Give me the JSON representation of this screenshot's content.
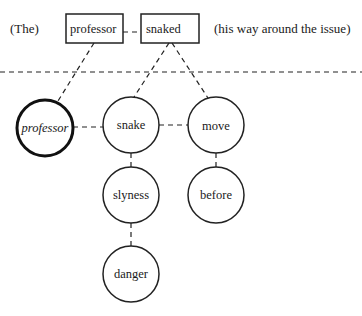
{
  "top_row": {
    "left_context": "(The)",
    "right_context": "(his way around the issue)",
    "boxes": [
      {
        "label": "professor"
      },
      {
        "label": "snaked"
      }
    ]
  },
  "nodes": {
    "professor": {
      "label": "professor",
      "style": "italic-bold-outline"
    },
    "snake": {
      "label": "snake"
    },
    "move": {
      "label": "move"
    },
    "slyness": {
      "label": "slyness"
    },
    "before": {
      "label": "before"
    },
    "danger": {
      "label": "danger"
    }
  }
}
